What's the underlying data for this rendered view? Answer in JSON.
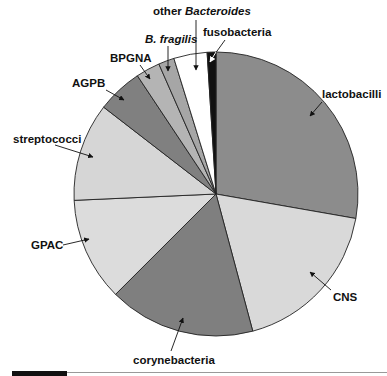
{
  "chart_data": {
    "type": "pie",
    "title": "",
    "start_angle_deg": 0,
    "direction": "clockwise",
    "slices": [
      {
        "label": "lactobacilli",
        "value": 27.8,
        "color": "#8c8c8c",
        "italic_part": ""
      },
      {
        "label": "CNS",
        "value": 18.1,
        "color": "#d9d9d9",
        "italic_part": ""
      },
      {
        "label": "corynebacteria",
        "value": 16.7,
        "color": "#7f7f7f",
        "italic_part": ""
      },
      {
        "label": "GPAC",
        "value": 11.8,
        "color": "#dcdcdc",
        "italic_part": ""
      },
      {
        "label": "streptococci",
        "value": 11.2,
        "color": "#d6d6d6",
        "italic_part": ""
      },
      {
        "label": "AGPB",
        "value": 5.2,
        "color": "#808080",
        "italic_part": ""
      },
      {
        "label": "BPGNA",
        "value": 2.75,
        "color": "#b4b4b4",
        "italic_part": ""
      },
      {
        "label": "B. fragilis",
        "value": 1.8,
        "color": "#a6a6a6",
        "italic_part": "B. fragilis"
      },
      {
        "label": "other Bacteroides",
        "value": 3.8,
        "color": "#ffffff",
        "italic_part": "Bacteroides"
      },
      {
        "label": "fusobacteria",
        "value": 1.0,
        "color": "#111111",
        "italic_part": ""
      }
    ],
    "legend": "none (callout labels with arrows)"
  },
  "labels": {
    "lactobacilli": "lactobacilli",
    "cns": "CNS",
    "corynebacteria": "corynebacteria",
    "gpac": "GPAC",
    "streptococci": "streptococci",
    "agpb": "AGPB",
    "bpgna": "BPGNA",
    "bfragilis": "B. fragilis",
    "other_prefix": "other ",
    "other_italic": "Bacteroides",
    "fusobacteria": "fusobacteria"
  }
}
